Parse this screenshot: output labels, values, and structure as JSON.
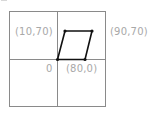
{
  "diagram": {
    "grid": {
      "outer_box": {
        "x": 9,
        "y": 11,
        "width": 97,
        "height": 96
      },
      "center_vertical_x": 57,
      "center_horizontal_y": 59,
      "line_color": "#8a8a8a"
    },
    "shape": {
      "type": "parallelogram",
      "stroke_color": "#111111",
      "vertices": [
        {
          "x": 57,
          "y": 59
        },
        {
          "x": 85,
          "y": 59
        },
        {
          "x": 92,
          "y": 31
        },
        {
          "x": 65,
          "y": 31
        }
      ]
    },
    "labels": {
      "top_left_point": "(10,70)",
      "top_right_point": "(90,70)",
      "origin": "0",
      "bottom_right_point": "(80,0)"
    },
    "label_color": "#a8a8a8"
  }
}
